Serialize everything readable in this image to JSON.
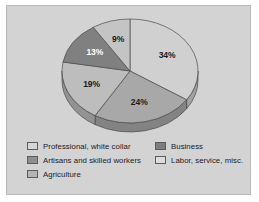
{
  "figure": {
    "background_color": "#d3d3d3",
    "border_color": "#b9b9b9",
    "page_background": "#ffffff"
  },
  "chart_data": {
    "type": "pie",
    "title": "",
    "subtitle": "",
    "xlabel": "",
    "ylabel": "",
    "grid": false,
    "legend_position": "bottom",
    "start_angle_oclock": 12,
    "direction": "clockwise",
    "three_d": true,
    "categories": [
      "Professional, white collar",
      "Business",
      "Artisans and skilled workers",
      "Agriculture",
      "Labor, service, misc."
    ],
    "values": [
      34,
      24,
      19,
      13,
      9
    ],
    "slices": [
      {
        "label": "Professional, white collar",
        "value": 34,
        "data_label": "34%",
        "color": "#d0d0d0",
        "label_color": "#1a1a1a"
      },
      {
        "label": "Business",
        "value": 24,
        "data_label": "24%",
        "color": "#a8a8a8",
        "label_color": "#1a1a1a"
      },
      {
        "label": "Artisans and skilled workers",
        "value": 19,
        "data_label": "19%",
        "color": "#bdbdbd",
        "label_color": "#1a1a1a"
      },
      {
        "label": "Agriculture",
        "value": 13,
        "data_label": "13%",
        "color": "#808080",
        "label_color": "#ffffff"
      },
      {
        "label": "Labor, service, misc.",
        "value": 9,
        "data_label": "9%",
        "color": "#c4c4c4",
        "label_color": "#1a1a1a"
      }
    ],
    "data_labels": [
      "34%",
      "24%",
      "19%",
      "13%",
      "9%"
    ]
  },
  "legend": {
    "columns": [
      {
        "items": [
          {
            "label": "Professional, white collar",
            "color": "#d6d6d6"
          },
          {
            "label": "Artisans and skilled workers",
            "color": "#8f8f8f"
          },
          {
            "label": "Agriculture",
            "color": "#b5b5b5"
          }
        ]
      },
      {
        "items": [
          {
            "label": "Business",
            "color": "#7d7d7d"
          },
          {
            "label": "Labor, service, misc.",
            "color": "#dcdcdc"
          }
        ]
      }
    ]
  }
}
